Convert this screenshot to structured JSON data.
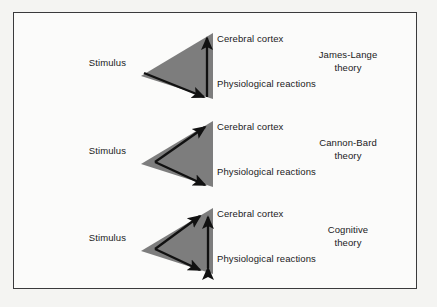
{
  "figure": {
    "background_color": "#f4f4f2",
    "panel_color": "#fbfbfa",
    "border_color": "#3a3a3c",
    "triangle_color": "#7d7d7d",
    "arrow_color": "#111111",
    "text_color": "#1a1a1a"
  },
  "labels": {
    "stimulus": "Stimulus",
    "cerebral_cortex_line1": "Cerebral",
    "cerebral_cortex_line2": "cortex",
    "physiological_line1": "Physiological",
    "physiological_line2": "reactions"
  },
  "rows": [
    {
      "id": "james-lange",
      "stimulus": "Stimulus",
      "node_top_line1": "Cerebral",
      "node_top_line2": "cortex",
      "node_bottom_line1": "Physiological",
      "node_bottom_line2": "reactions",
      "theory_line1": "James-Lange",
      "theory_line2": "theory",
      "arrows": "stimulus-to-physiological-then-up-to-cortex",
      "vertical_arrow": "single-up",
      "fork_arrows": "down-only"
    },
    {
      "id": "cannon-bard",
      "stimulus": "Stimulus",
      "node_top_line1": "Cerebral",
      "node_top_line2": "cortex",
      "node_bottom_line1": "Physiological",
      "node_bottom_line2": "reactions",
      "theory_line1": "Cannon-Bard",
      "theory_line2": "theory",
      "arrows": "stimulus-forks-to-cortex-and-physiological",
      "vertical_arrow": "none",
      "fork_arrows": "both"
    },
    {
      "id": "cognitive",
      "stimulus": "Stimulus",
      "node_top_line1": "Cerebral",
      "node_top_line2": "cortex",
      "node_bottom_line1": "Physiological",
      "node_bottom_line2": "reactions",
      "theory_line1": "Cognitive",
      "theory_line2": "theory",
      "arrows": "stimulus-forks-to-both-plus-bidirectional-link",
      "vertical_arrow": "double",
      "fork_arrows": "both"
    }
  ]
}
